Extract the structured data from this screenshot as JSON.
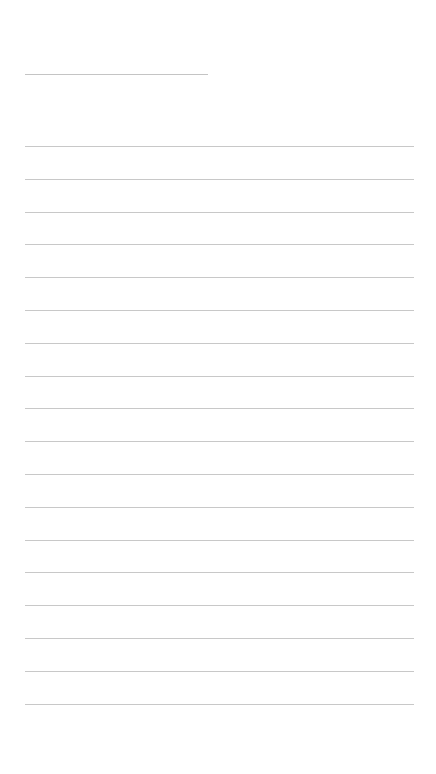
{
  "document": {
    "type": "lined-paper",
    "background_color": "#ffffff",
    "line_color": "#c8c8c8",
    "title_line": {
      "x": 25,
      "y": 74,
      "width": 183
    },
    "rules": {
      "x": 25,
      "width": 389,
      "first_y": 146,
      "spacing": 32.8,
      "count": 18
    }
  }
}
